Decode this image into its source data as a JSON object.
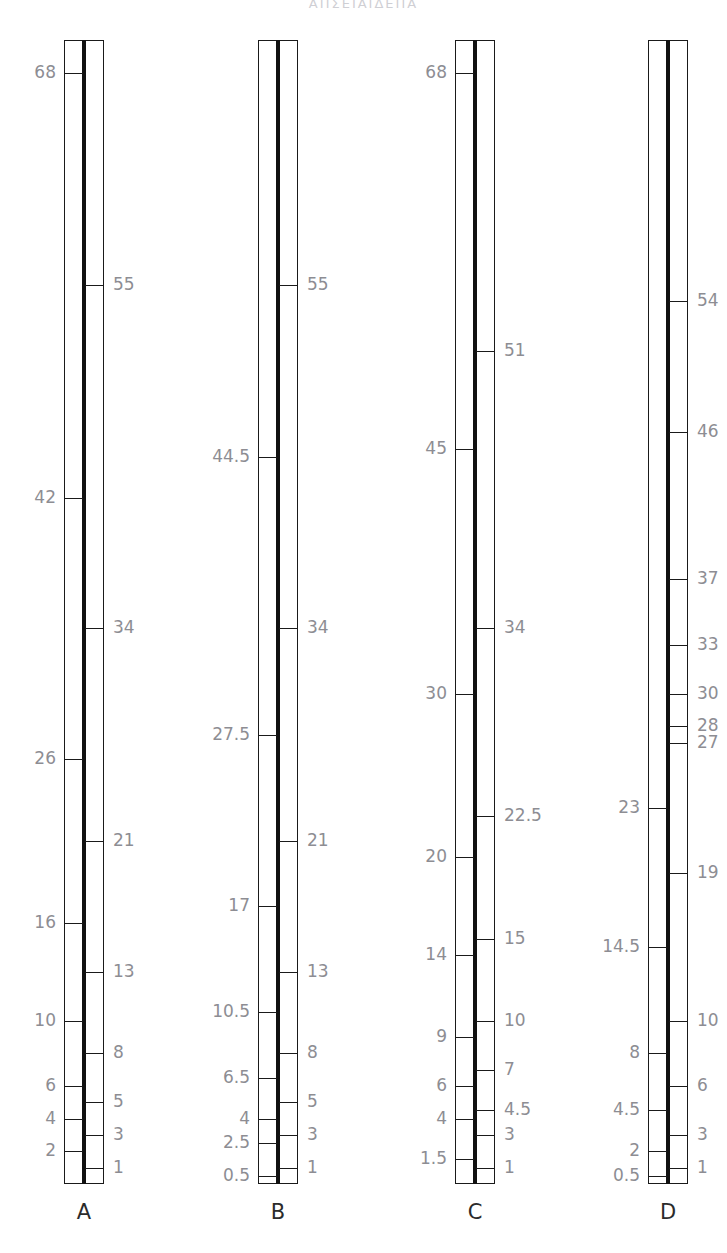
{
  "header": {
    "title": "ΑΠΣΕΙΑΙΔΕΠΑ"
  },
  "figure": {
    "background_color": "#ffffff",
    "line_color": "#1a1a1a",
    "label_color": "#8d8d93",
    "column_label_color": "#2b2b2b",
    "axis_top_value": 70,
    "axis_bottom_value": 0
  },
  "chart_data": {
    "type": "table",
    "title": "",
    "xlabel": "",
    "ylabel": "",
    "ylim": [
      0,
      70
    ],
    "grid": false,
    "legend": "none",
    "columns": [
      {
        "name": "A",
        "left_labels": [
          "68",
          "42",
          "26",
          "16",
          "10",
          "6",
          "4",
          "2"
        ],
        "left_values": [
          68,
          42,
          26,
          16,
          10,
          6,
          4,
          2
        ],
        "right_labels": [
          "55",
          "34",
          "21",
          "13",
          "8",
          "5",
          "3",
          "1"
        ],
        "right_values": [
          55,
          34,
          21,
          13,
          8,
          5,
          3,
          1
        ]
      },
      {
        "name": "B",
        "left_labels": [
          "44.5",
          "27.5",
          "17",
          "10.5",
          "6.5",
          "4",
          "2.5",
          "0.5"
        ],
        "left_values": [
          44.5,
          27.5,
          17,
          10.5,
          6.5,
          4,
          2.5,
          0.5
        ],
        "right_labels": [
          "55",
          "34",
          "21",
          "13",
          "8",
          "5",
          "3",
          "1"
        ],
        "right_values": [
          55,
          34,
          21,
          13,
          8,
          5,
          3,
          1
        ]
      },
      {
        "name": "C",
        "left_labels": [
          "68",
          "45",
          "30",
          "20",
          "14",
          "9",
          "6",
          "4",
          "1.5"
        ],
        "left_values": [
          68,
          45,
          30,
          20,
          14,
          9,
          6,
          4,
          1.5
        ],
        "right_labels": [
          "51",
          "34",
          "22.5",
          "15",
          "10",
          "7",
          "4.5",
          "3",
          "1"
        ],
        "right_values": [
          51,
          34,
          22.5,
          15,
          10,
          7,
          4.5,
          3,
          1
        ]
      },
      {
        "name": "D",
        "left_labels": [
          "23",
          "14.5",
          "8",
          "4.5",
          "2",
          "0.5"
        ],
        "left_values": [
          23,
          14.5,
          8,
          4.5,
          2,
          0.5
        ],
        "right_labels": [
          "54",
          "46",
          "37",
          "33",
          "30",
          "28",
          "27",
          "19",
          "10",
          "6",
          "3",
          "1"
        ],
        "right_values": [
          54,
          46,
          37,
          33,
          30,
          28,
          27,
          19,
          10,
          6,
          3,
          1
        ]
      }
    ]
  },
  "columns_layout": [
    {
      "key": "A",
      "bar_left": 64,
      "bar_width": 40
    },
    {
      "key": "B",
      "bar_left": 258,
      "bar_width": 40
    },
    {
      "key": "C",
      "bar_left": 455,
      "bar_width": 40
    },
    {
      "key": "D",
      "bar_left": 648,
      "bar_width": 40
    }
  ]
}
